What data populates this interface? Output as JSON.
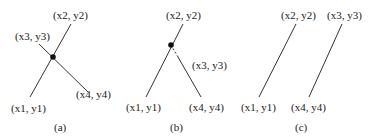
{
  "panels": [
    {
      "caption": "(a)",
      "labels": {
        "p1": "(x1, y1)",
        "p2": "(x2, y2)",
        "p3": "(x3, y3)",
        "p4": "(x4, y4)"
      },
      "description": "Two segments crossing at an intersection point"
    },
    {
      "caption": "(b)",
      "labels": {
        "p1": "(x1, y1)",
        "p2": "(x2, y2)",
        "p3": "(x3, y3)",
        "p4": "(x4, y4)"
      },
      "description": "Segments meeting at a point with dashed extension toward (x3, y3)"
    },
    {
      "caption": "(c)",
      "labels": {
        "p1": "(x1, y1)",
        "p2": "(x2, y2)",
        "p3": "(x3, y3)",
        "p4": "(x4, y4)"
      },
      "description": "Two parallel non-intersecting segments"
    }
  ],
  "colors": {
    "line": "#333333",
    "text": "#222222",
    "background": "#ffffff"
  }
}
